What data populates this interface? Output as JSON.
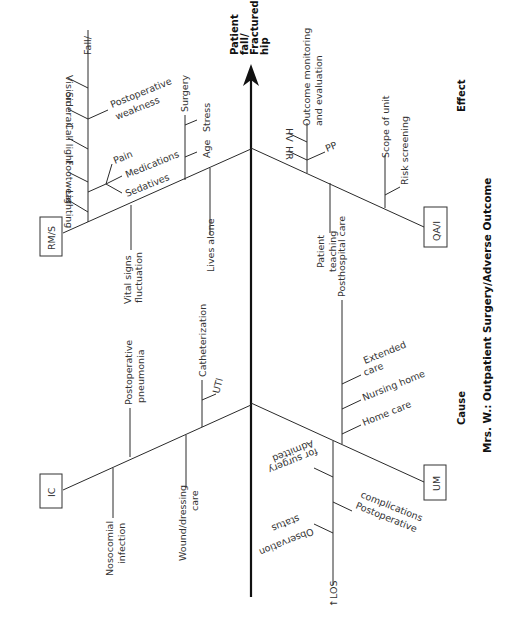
{
  "title": "Mrs. W.: Outpatient Surgery/Adverse Outcome",
  "cause_label": "Cause",
  "effect_label": "Effect",
  "effect": {
    "line1": "Patient",
    "line2": "fall/",
    "line3": "Fractured",
    "line4": "hip"
  },
  "categories": {
    "rms": {
      "box": "RM/S",
      "fall": "Fall/",
      "vision": "Vision",
      "siderail": "Siderail",
      "call_light": "Call light",
      "footwear": "Footwear",
      "lighting": "Lighting",
      "postop_weakness_1": "Postoperative",
      "postop_weakness_2": "weakness",
      "pain": "Pain",
      "medications": "Medications",
      "sedatives": "Sedatives",
      "surgery": "Surgery",
      "stress": "Stress",
      "age": "Age",
      "vital_signs_1": "Vital signs",
      "vital_signs_2": "fluctuation",
      "lives_alone": "Lives alone"
    },
    "qai": {
      "box": "QA/I",
      "outcome_1": "Outcome monitoring",
      "outcome_2": "and evaluation",
      "hv": "HV",
      "hr": "HR",
      "pp": "PP",
      "patient_teaching_1": "Patient",
      "patient_teaching_2": "teaching",
      "scope_of_unit": "Scope of unit",
      "risk_screening": "Risk screening"
    },
    "ic": {
      "box": "IC",
      "nosocomial_1": "Nosocomial",
      "nosocomial_2": "infection",
      "postop_pneumonia_1": "Postoperative",
      "postop_pneumonia_2": "pneumonia",
      "wound_1": "Wound/dressing",
      "wound_2": "care",
      "catheterization": "Catheterization",
      "uti": "UTI"
    },
    "um": {
      "box": "UM",
      "posthospital": "Posthospital care",
      "extended_1": "Extended",
      "extended_2": "care",
      "nursing_home": "Nursing home",
      "home_care": "Home care",
      "admitted_1": "Admitted",
      "admitted_2": "for surgery",
      "observation_1": "Observation",
      "observation_2": "status",
      "postop_comp_1": "Postoperative",
      "postop_comp_2": "complications",
      "los": "↑LOS"
    }
  }
}
